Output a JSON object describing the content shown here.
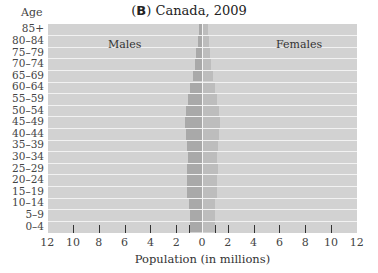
{
  "chart_data": {
    "type": "bar",
    "orientation": "horizontal",
    "subtype": "population-pyramid",
    "title_prefix": "(B)",
    "title": "Canada, 2009",
    "ylabel": "Age",
    "xlabel": "Population (in millions)",
    "xlim": [
      -12,
      12
    ],
    "x_ticks": [
      "12",
      "10",
      "8",
      "6",
      "4",
      "2",
      "0",
      "2",
      "4",
      "6",
      "8",
      "10",
      "12"
    ],
    "categories": [
      "0–4",
      "5–9",
      "10–14",
      "15–19",
      "20–24",
      "25–29",
      "30–34",
      "35–39",
      "40–44",
      "45–49",
      "50–54",
      "55–59",
      "60–64",
      "65–69",
      "70–74",
      "75–79",
      "80–84",
      "85+"
    ],
    "series": [
      {
        "name": "Males",
        "values": [
          0.95,
          0.95,
          1.0,
          1.15,
          1.15,
          1.15,
          1.1,
          1.15,
          1.25,
          1.35,
          1.25,
          1.1,
          0.95,
          0.7,
          0.55,
          0.45,
          0.3,
          0.2
        ]
      },
      {
        "name": "Females",
        "values": [
          0.9,
          0.9,
          0.95,
          1.1,
          1.1,
          1.15,
          1.1,
          1.15,
          1.25,
          1.35,
          1.25,
          1.1,
          0.95,
          0.75,
          0.6,
          0.55,
          0.45,
          0.35
        ]
      }
    ],
    "annotations": [
      "Males",
      "Females"
    ],
    "grid": false,
    "legend": "none (inline labels)"
  },
  "labels": {
    "title_prefix": "B",
    "title_text": "Canada, 2009",
    "age": "Age",
    "males": "Males",
    "females": "Females",
    "xtitle": "Population (in millions)"
  }
}
